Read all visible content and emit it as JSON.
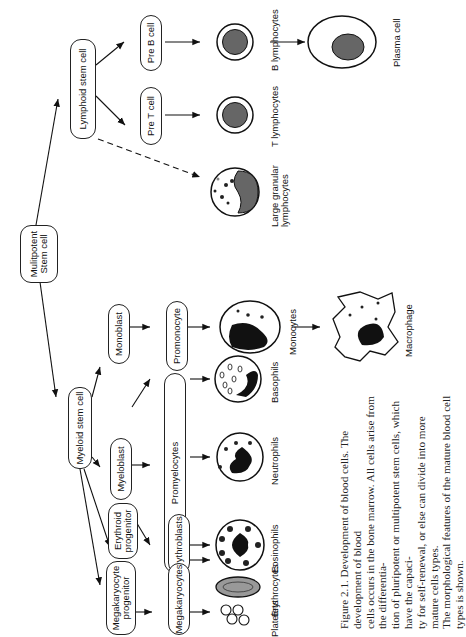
{
  "figure": {
    "nodes": {
      "multipotent": "Mulitpotent\nStem cell",
      "lymphoid": "Lymphoid stem cell",
      "myeloid": "Myeloid stem cell",
      "pre_b": "Pre B cell",
      "pre_t": "Pre T cell",
      "monoblast": "Monoblast",
      "promonocyte": "Promonocyte",
      "myeloblast": "Myeloblast",
      "promyelocytes": "Promyelocytes",
      "erythroid_progenitor": "Erythroid\nprogenitor",
      "erythroblasts": "Erythroblasts",
      "megakaryocyte_progenitor": "Megakaryocyte\nprogenitor",
      "megakaryocytes": "Megakaryocytes"
    },
    "cell_labels": {
      "b_lymphocytes": "B lymphocytes",
      "plasma_cell": "Plasma cell",
      "t_lymphocytes": "T lymphocytes",
      "large_granular": "Large granular\nlymphocytes",
      "monocytes": "Monocytes",
      "macrophage": "Macrophage",
      "basophils": "Basophils",
      "neutrophils": "Neutrophils",
      "eosinophils": "Eosinophils",
      "erythrocytes": "Erythrocytes",
      "platelets": "Platelets"
    },
    "caption": {
      "line1": "Figure 2.1. Development of blood cells. The development of blood",
      "line2": "cells occurs in the bone marrow. All cells arise from the differentia-",
      "line3": "tion of pluripotent or multipotent stem cells, which have the capaci-",
      "line4": "ty for self-renewal, or else can divide into more mature cells types.",
      "line5": "The morphological features of the mature blood cell types is shown."
    }
  }
}
